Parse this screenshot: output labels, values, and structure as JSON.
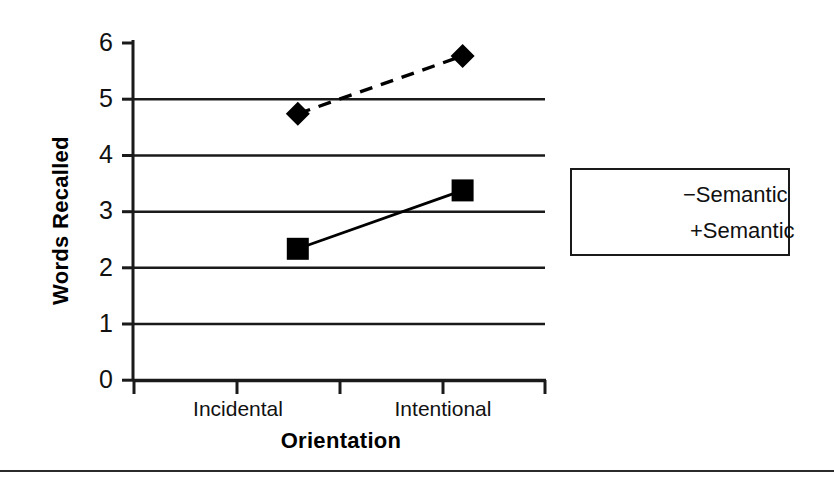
{
  "chart_data": {
    "type": "line",
    "title": "",
    "xlabel": "Orientation",
    "ylabel": "Words Recalled",
    "categories": [
      "Incidental",
      "Intentional"
    ],
    "series": [
      {
        "name": "−Semantic",
        "values": [
          4.7,
          5.72
        ],
        "marker": "diamond",
        "linestyle": "dashed",
        "color": "#000000"
      },
      {
        "name": "+Semantic",
        "values": [
          2.32,
          3.35
        ],
        "marker": "square",
        "linestyle": "solid",
        "color": "#000000"
      }
    ],
    "ylim": [
      0,
      6
    ],
    "yticks": [
      0,
      1,
      2,
      3,
      4,
      5,
      6
    ],
    "ytick_labels": [
      "0",
      "1",
      "2",
      "3",
      "4",
      "5",
      "6"
    ],
    "grid": true,
    "grid_axis": "y",
    "legend_position": "right",
    "background": "#ffffff",
    "axis_color": "#1a1a1a"
  },
  "axes": {
    "y_title": "Words Recalled",
    "x_title": "Orientation",
    "y_ticks": [
      "6",
      "5",
      "4",
      "3",
      "2",
      "1",
      "0"
    ],
    "x_ticks": [
      "Incidental",
      "Intentional"
    ]
  },
  "legend": {
    "items": [
      {
        "label": "−Semantic",
        "marker": "diamond",
        "linestyle": "dashed"
      },
      {
        "label": "+Semantic",
        "marker": "square",
        "linestyle": "solid"
      }
    ]
  }
}
